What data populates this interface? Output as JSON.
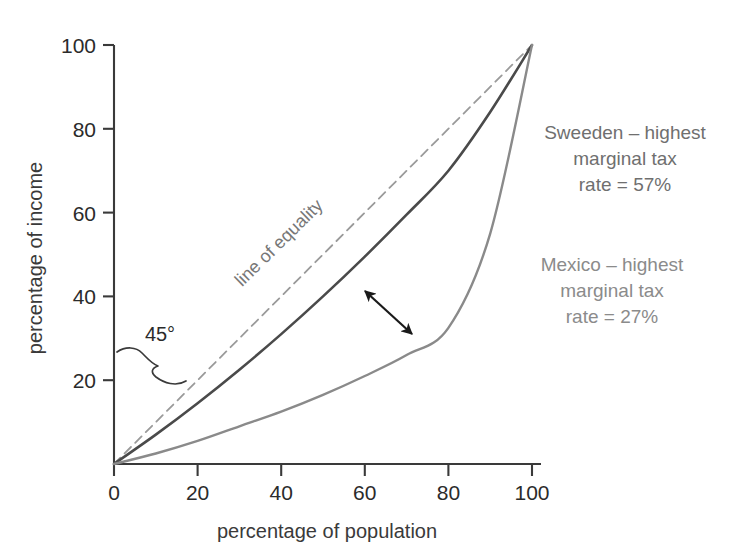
{
  "chart_data": {
    "type": "line",
    "title": "",
    "xlabel": "percentage of population",
    "ylabel": "percentage of income",
    "xlim": [
      0,
      108
    ],
    "ylim": [
      0,
      108
    ],
    "xticks": [
      "0",
      "20",
      "40",
      "60",
      "80",
      "100"
    ],
    "xtick_values": [
      0,
      20,
      40,
      60,
      80,
      100
    ],
    "yticks": [
      "20",
      "40",
      "60",
      "80",
      "100"
    ],
    "ytick_values": [
      20,
      40,
      60,
      80,
      100
    ],
    "grid": false,
    "legend_position": "inline-annotations",
    "series": [
      {
        "name": "line of equality",
        "style": "dashed",
        "color": "#9a9a9a",
        "x": [
          0,
          100
        ],
        "values": [
          0,
          100
        ]
      },
      {
        "name": "Sweeden",
        "style": "solid",
        "color": "#4a4a4a",
        "x": [
          0,
          10,
          20,
          30,
          40,
          50,
          60,
          70,
          80,
          90,
          100
        ],
        "values": [
          0,
          7.0,
          14.5,
          22.5,
          31.0,
          40.0,
          49.5,
          59.5,
          70.0,
          84.0,
          100
        ]
      },
      {
        "name": "Mexico",
        "style": "solid",
        "color": "#8a8a8a",
        "x": [
          0,
          10,
          20,
          30,
          40,
          50,
          60,
          70,
          80,
          90,
          100
        ],
        "values": [
          0,
          2.5,
          5.5,
          9.0,
          12.5,
          16.5,
          21.0,
          26.0,
          32.5,
          55.0,
          100
        ]
      }
    ],
    "annotations": [
      {
        "name": "line-of-equality-label",
        "text": "line of equality",
        "rotated": true,
        "color": "#777777"
      },
      {
        "name": "angle-label",
        "text": "45°",
        "color": "#2b2b2b"
      },
      {
        "name": "sweden-callout",
        "lines": [
          "Sweeden – highest",
          "marginal tax",
          "rate = 57%"
        ],
        "color": "#6f6f6f"
      },
      {
        "name": "mexico-callout",
        "lines": [
          "Mexico – highest",
          "marginal tax",
          "rate = 27%"
        ],
        "color": "#8b8b8b"
      },
      {
        "name": "gap-arrow",
        "description": "double-headed arrow between Sweeden and Mexico curves"
      },
      {
        "name": "angle-brace",
        "description": "curly brace spanning the 45 degree angle at the origin"
      }
    ]
  },
  "axes": {
    "x_title": "percentage of population",
    "y_title": "percentage of income",
    "x_tick_labels": [
      "0",
      "20",
      "40",
      "60",
      "80",
      "100"
    ],
    "y_tick_labels": [
      "20",
      "40",
      "60",
      "80",
      "100"
    ]
  },
  "callouts": {
    "sweden": {
      "line1": "Sweeden – highest",
      "line2": "marginal tax",
      "line3": "rate = 57%"
    },
    "mexico": {
      "line1": "Mexico – highest",
      "line2": "marginal tax",
      "line3": "rate = 27%"
    },
    "equality": "line of equality",
    "angle": "45°"
  },
  "colors": {
    "axis": "#3a3a3a",
    "equality_line": "#9a9a9a",
    "sweden_line": "#4a4a4a",
    "mexico_line": "#8a8a8a",
    "sweden_text": "#6f6f6f",
    "mexico_text": "#8b8b8b",
    "background": "#ffffff"
  }
}
